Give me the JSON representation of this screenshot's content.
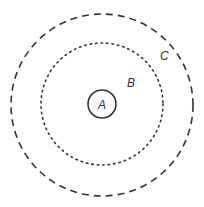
{
  "diagram": {
    "type": "concentric-circles",
    "center": [
      102,
      105
    ],
    "circles": [
      {
        "id": "A",
        "label": "A",
        "radius": 14,
        "style": "solid"
      },
      {
        "id": "B",
        "label": "B",
        "radius": 61,
        "style": "dotted"
      },
      {
        "id": "C",
        "label": "C",
        "radius": 91,
        "style": "dashed"
      }
    ],
    "labels": {
      "a": "A",
      "b": "B",
      "c": "C"
    },
    "stroke_color": "#333333"
  }
}
